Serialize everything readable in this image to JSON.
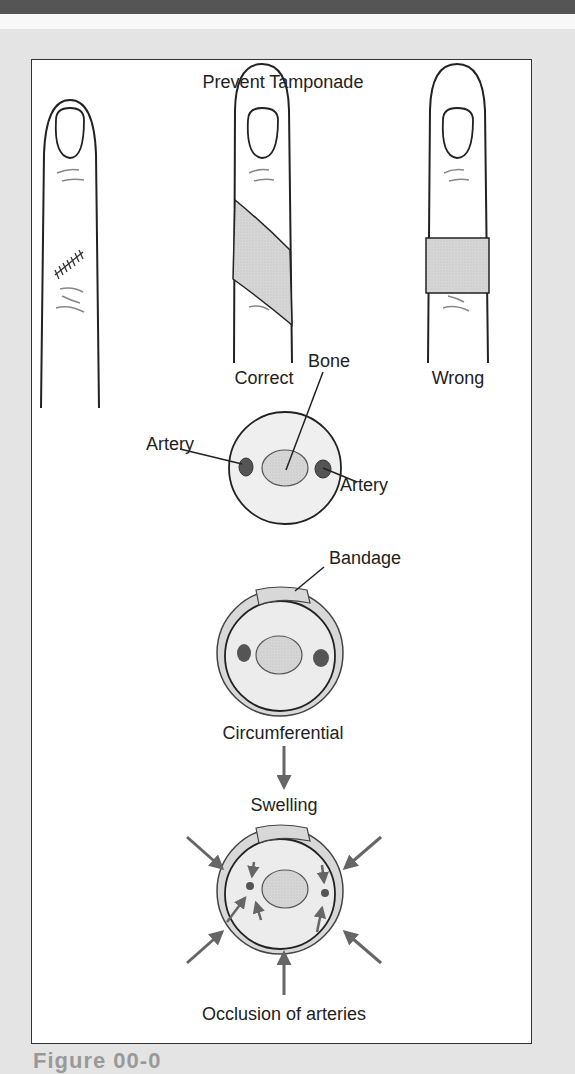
{
  "figure": {
    "title": "Prevent Tamponade",
    "finger_labels": {
      "left": "",
      "middle": "Correct",
      "right": "Wrong"
    },
    "cross_section_normal": {
      "label_bone": "Bone",
      "label_artery_left": "Artery",
      "label_artery_right": "Artery"
    },
    "cross_section_bandaged": {
      "label_bandage": "Bandage",
      "label_caption": "Circumferential"
    },
    "swelling": {
      "label": "Swelling",
      "result": "Occlusion of arteries"
    },
    "caption_partial": "Figure 00-0"
  },
  "colors": {
    "page_background": "#e4e4e4",
    "banner": "#555555",
    "bandage_fill": "#d8d8d8",
    "tissue_fill": "#ececec",
    "bone_fill": "#dcdcdc",
    "artery_fill": "#555555",
    "arrow": "#666666"
  }
}
